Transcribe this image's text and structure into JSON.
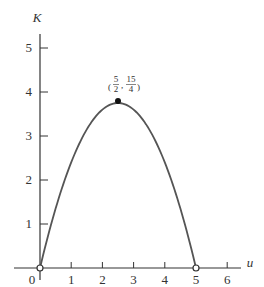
{
  "chart_data": {
    "type": "line",
    "title": "",
    "xlabel": "u",
    "ylabel": "K",
    "function": "K = u(5 - u)... parabola with max at (5/2, 15/4)",
    "x": [
      0,
      0.5,
      1,
      1.5,
      2,
      2.5,
      3,
      3.5,
      4,
      4.5,
      5
    ],
    "series": [
      {
        "name": "K(u)",
        "values": [
          0,
          1.35,
          2.4,
          3.15,
          3.6,
          3.75,
          3.6,
          3.15,
          2.4,
          1.35,
          0
        ]
      }
    ],
    "xlim": [
      -0.5,
      6.5
    ],
    "ylim": [
      0,
      5.4
    ],
    "x_ticks": [
      "0",
      "1",
      "2",
      "3",
      "4",
      "5",
      "6"
    ],
    "y_ticks": [
      "1",
      "2",
      "3",
      "4",
      "5"
    ],
    "grid": false,
    "legend": null,
    "annotations": [
      {
        "label_num_x": "5",
        "label_den_x": "2",
        "label_num_y": "15",
        "label_den_y": "4",
        "point": [
          2.5,
          3.75
        ],
        "marker": "filled-circle"
      }
    ],
    "endpoints": [
      {
        "point": [
          0,
          0
        ],
        "marker": "open-circle"
      },
      {
        "point": [
          5,
          0
        ],
        "marker": "open-circle"
      }
    ],
    "colors": {
      "curve": "#555555",
      "axis": "#333333"
    }
  }
}
